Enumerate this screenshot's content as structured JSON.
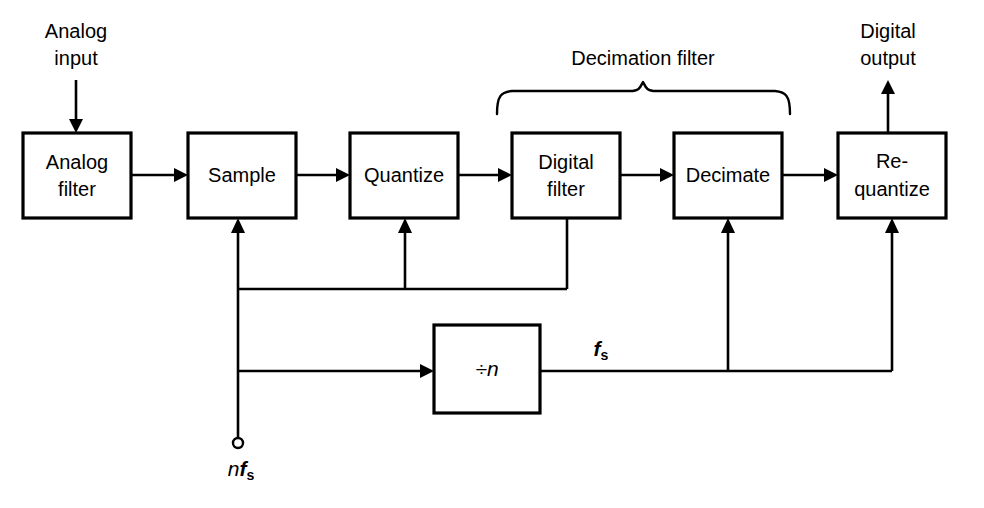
{
  "diagram": {
    "background_color": "#ffffff",
    "line_color": "#000000",
    "blocks": [
      {
        "id": "analog-filter",
        "label_line1": "Analog",
        "label_line2": "filter",
        "x": 23,
        "y": 133,
        "w": 108,
        "h": 85
      },
      {
        "id": "sample",
        "label_line1": "Sample",
        "label_line2": "",
        "x": 188,
        "y": 133,
        "w": 108,
        "h": 85
      },
      {
        "id": "quantize",
        "label_line1": "Quantize",
        "label_line2": "",
        "x": 350,
        "y": 133,
        "w": 108,
        "h": 85
      },
      {
        "id": "digital-filter",
        "label_line1": "Digital",
        "label_line2": "filter",
        "x": 512,
        "y": 133,
        "w": 108,
        "h": 85
      },
      {
        "id": "decimate",
        "label_line1": "Decimate",
        "label_line2": "",
        "x": 674,
        "y": 133,
        "w": 108,
        "h": 85
      },
      {
        "id": "re-quantize",
        "label_line1": "Re-",
        "label_line2": "quantize",
        "x": 838,
        "y": 133,
        "w": 108,
        "h": 85
      },
      {
        "id": "divider",
        "label_line1": "÷n",
        "label_line2": "",
        "x": 434,
        "y": 325,
        "w": 106,
        "h": 88
      }
    ],
    "io_labels": [
      {
        "id": "analog-input",
        "line1": "Analog",
        "line2": "input",
        "x": 76,
        "y": 33
      },
      {
        "id": "digital-output",
        "line1": "Digital",
        "line2": "output",
        "x": 888,
        "y": 33
      }
    ],
    "group_label": {
      "id": "decimation-filter",
      "text": "Decimation filter",
      "x": 643,
      "y": 60
    },
    "signal_labels": [
      {
        "id": "nfs",
        "prefix": "n",
        "base": "f",
        "sub": "s",
        "x": 241,
        "y": 470
      },
      {
        "id": "fs",
        "prefix": "",
        "base": "f",
        "sub": "s",
        "x": 601,
        "y": 350
      }
    ],
    "clock_source": {
      "id": "nfs-terminal",
      "x": 238,
      "y": 443,
      "r": 5
    }
  }
}
